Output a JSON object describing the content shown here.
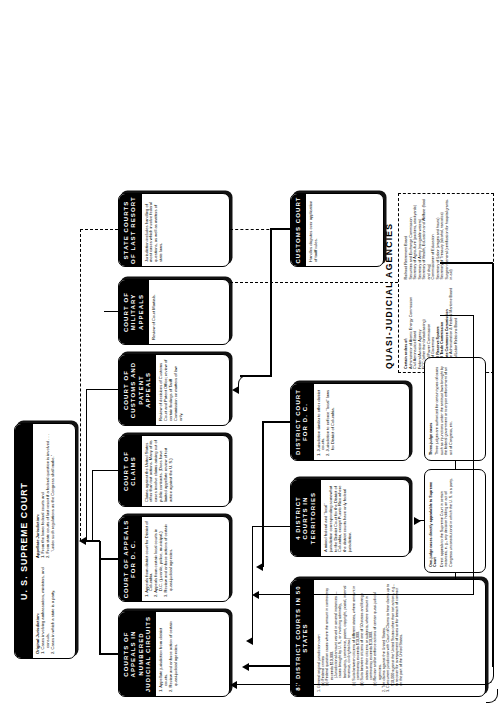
{
  "document": {
    "title": "The Federal Court System",
    "orientation": "landscape chart rotated 90 degrees on a portrait page"
  },
  "boxes": {
    "supreme_court": {
      "title": "U. S.  SUPREME COURT",
      "original_heading": "Original Jurisdiction:",
      "original_items": [
        "1. Cases involving ambassadors, ministers, and consuls.",
        "2. Cases in which a state is a party."
      ],
      "appellate_heading": "Appellate Jurisdiction:",
      "appellate_items": [
        "1. From the lower federal courts and",
        "2. From state courts of last resort if a federal question is involved . . . \"under such regulations as the Congress shall make.\""
      ]
    },
    "courts_of_appeals_circuits": {
      "title": "COURTS OF APPEALS IN NUMBERED JUDICIAL CIRCUITS",
      "items": [
        "1. Appellate jurisdiction from district courts.",
        "2. Review and enforce action of certain quasi-judicial agencies."
      ]
    },
    "court_of_appeals_dc": {
      "title": "COURT OF APPEALS FOR D. C.",
      "items": [
        "1. Appeals from district court for District of Columbia.",
        "2. Appeals from certain local courts in D.C. (juvenile, police, municipal.)",
        "3. Review and enforce actions of certain quasi-judicial agencies."
      ]
    },
    "court_of_claims": {
      "title": "COURT OF CLAIMS",
      "body": "Claims against the United States other than tort actions. Many of its cases involve claims arising out of public contracts. (Does have limited appellate review of tort action against the U. S.)"
    },
    "court_of_customs_and_patent_appeals": {
      "title": "COURT OF CUSTOMS AND PATENT APPEALS",
      "body": "Review of decisions of Customs Court and Patent Office; review of certain findings of Tariff Commission on matters of law only."
    },
    "court_of_military_appeals": {
      "title": "COURT OF MILITARY APPEALS",
      "body": "Review of Court Martials."
    },
    "state_courts_of_last_resort": {
      "title": "STATE COURTS OF LAST RESORT",
      "body": "Jurisdiction includes handling of most cases which involve federal questions, as well as matters of state laws."
    },
    "customs_court": {
      "title": "CUSTOMS COURT",
      "body": "Handles disputes over application of tariff rules."
    },
    "district_courts_87": {
      "title": "87 DISTRICT COURTS IN 50 STATES",
      "items": [
        "1. General original jurisdiction over:",
        "(a) Federal crimes",
        "(b) Federal question cases where the amount in controversy exceeds $10,000.",
        "(Jurisdictional amount waived in several instances — cases brought by U. S., or involving admiralty, bankruptcy, commerce, patent, copyright, postal, internal revenue, civil rights law.)",
        "(c) Suits between citizens of different states, where amount in controversy exceeds $10,000.",
        "(d) Suits between citizens of one of 50 states and foreign states or their citizens or subjects, where amount in controversy exceeds $10,000.",
        "(e) Review and/or enforce actions of certain quasi-judicial agencies.",
        "2. Tort claims against the United States.",
        "3. Concurrent jurisdiction with Court of Claims to hear claims up to $10,000 against the United States other than tort actions, e.g., to recover for overpayment of taxes or for breach of contract on the part of the United States."
      ]
    },
    "district_courts_territories": {
      "title": "4 DISTRICT COURTS IN TERRITORIES",
      "body": "A mixed federal and \"local\" jurisdiction corresponding somewhat to the District Court for the District of Columbia, except Puerto Rico where the district courts have only federal jurisdiction."
    },
    "district_court_dc": {
      "title": "DISTRICT COURT FOR D. C.",
      "items": [
        "1. Jurisdiction similar to other district courts.",
        "2. Jurisdiction to enforce \"local\" laws for District of Columbia."
      ]
    }
  },
  "notes": {
    "one_judge": {
      "heading": "One-judge cases directly appealable to Supreme Court",
      "body": "Direct appeals to the Supreme Court in certain instances, e. g., any decision holding an act of Congress unconstitutional in which the U. S. is a party."
    },
    "three_judge": {
      "heading": "Three-judge cases",
      "body": "Three judges are authorized for certain types of cases such as injunctions under the antitrust laws brought by the federal government or to enjoin enforcement of an act of Congress, etc."
    }
  },
  "quasi_judicial": {
    "title": "QUASI-JUDICIAL AGENCIES",
    "lead": "Certain orders of:",
    "column_one": [
      "Administrator of Atomic Energy Commission",
      "Civil Aeronautics Board",
      "Federal Aviation Agency",
      "FCC (other than broadcasting)",
      "Federal Power Commission",
      "Board of Governors",
      "Federal Reserve System",
      "Federal Trade Commission",
      "Interstate Commerce Commission",
      "Maritime Administration & Federal Maritime Board",
      "National Labor Relations Board"
    ],
    "column_two": [
      "Railroad Retirement Board",
      "Securities and Exchange Commission",
      "Secretary of Agriculture (packers, stockyards)",
      "Secretary of Army (navigable waters)",
      "Secretary of Health, Education and Welfare (food and drug)",
      "Commissioner of Education",
      "Secretary of Labor (wages and hours)",
      "Secretary of Treasury (alcohol, narcotics)",
      "Surgeon General (certification for hospital grants-in-aid)"
    ]
  }
}
